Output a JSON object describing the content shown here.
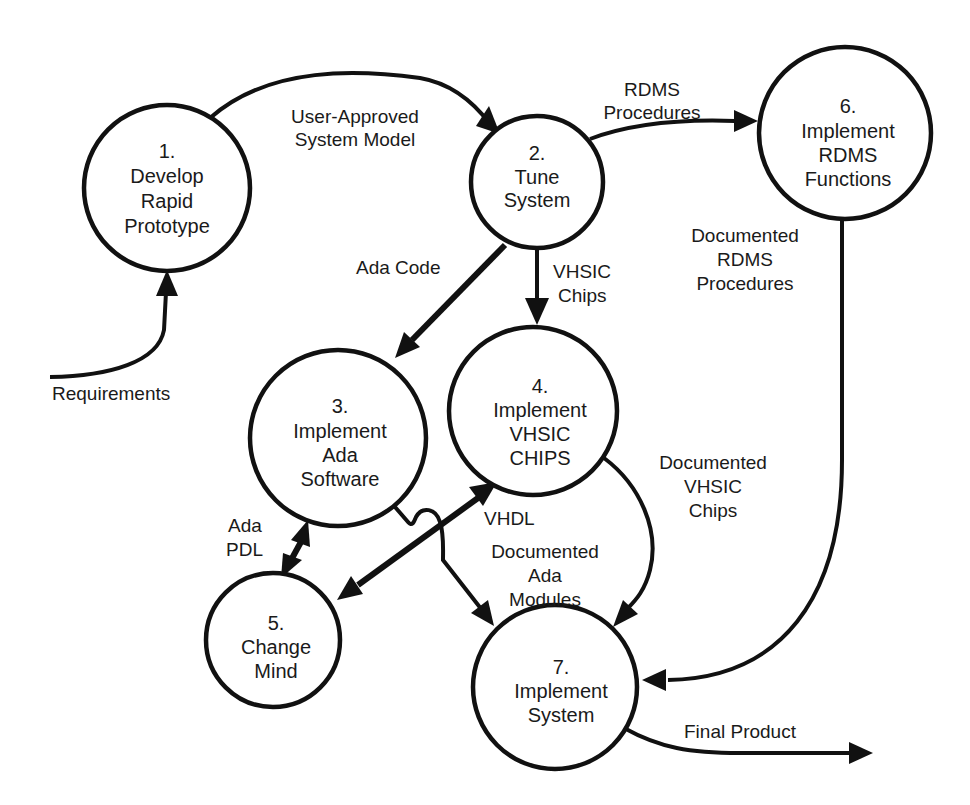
{
  "diagram": {
    "type": "data-flow-diagram",
    "colors": {
      "stroke": "#111111",
      "background": "#ffffff",
      "text": "#1a1a1a"
    },
    "processes": [
      {
        "id": 1,
        "number": "1.",
        "lines": [
          "Develop",
          "Rapid",
          "Prototype"
        ]
      },
      {
        "id": 2,
        "number": "2.",
        "lines": [
          "Tune",
          "System"
        ]
      },
      {
        "id": 3,
        "number": "3.",
        "lines": [
          "Implement",
          "Ada",
          "Software"
        ]
      },
      {
        "id": 4,
        "number": "4.",
        "lines": [
          "Implement",
          "VHSIC",
          "CHIPS"
        ]
      },
      {
        "id": 5,
        "number": "5.",
        "lines": [
          "Change",
          "Mind"
        ]
      },
      {
        "id": 6,
        "number": "6.",
        "lines": [
          "Implement",
          "RDMS",
          "Functions"
        ]
      },
      {
        "id": 7,
        "number": "7.",
        "lines": [
          "Implement",
          "System"
        ]
      }
    ],
    "flows": [
      {
        "from": "external",
        "to": 1,
        "lines": [
          "Requirements"
        ]
      },
      {
        "from": 1,
        "to": 2,
        "lines": [
          "User-Approved",
          "System Model"
        ]
      },
      {
        "from": 2,
        "to": 6,
        "lines": [
          "RDMS",
          "Procedures"
        ]
      },
      {
        "from": 2,
        "to": 3,
        "lines": [
          "Ada Code"
        ]
      },
      {
        "from": 2,
        "to": 4,
        "lines": [
          "VHSIC",
          "Chips"
        ]
      },
      {
        "from": 3,
        "to": 5,
        "bidirectional": true,
        "lines": [
          "Ada",
          "PDL"
        ]
      },
      {
        "from": 4,
        "to": 5,
        "bidirectional": true,
        "lines": [
          "VHDL"
        ]
      },
      {
        "from": 3,
        "to": 7,
        "lines": [
          "Documented",
          "Ada",
          "Modules"
        ]
      },
      {
        "from": 4,
        "to": 7,
        "lines": [
          "Documented",
          "VHSIC",
          "Chips"
        ]
      },
      {
        "from": 6,
        "to": 7,
        "lines": [
          "Documented",
          "RDMS",
          "Procedures"
        ]
      },
      {
        "from": 7,
        "to": "external",
        "lines": [
          "Final Product"
        ]
      }
    ]
  }
}
